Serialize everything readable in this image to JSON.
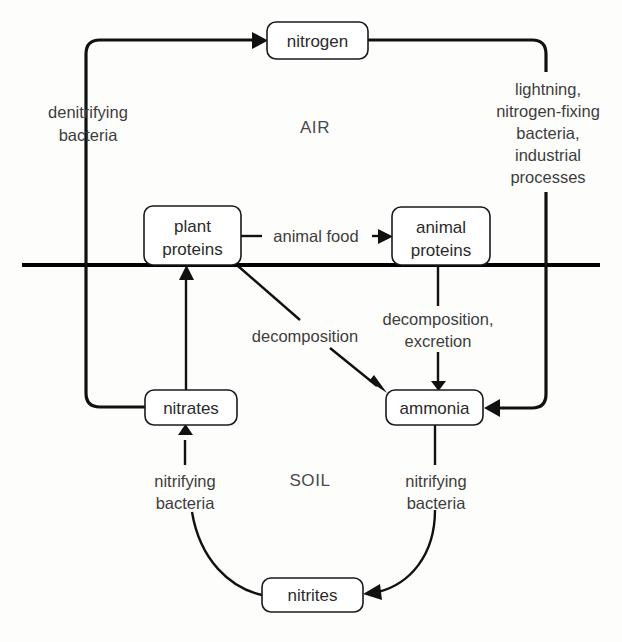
{
  "diagram": {
    "background_color": "#fdfdfc",
    "line_color": "#111111",
    "text_color": "#3a3a3a",
    "regions": [
      {
        "id": "air",
        "label": "AIR",
        "x": 315,
        "y": 127
      },
      {
        "id": "soil",
        "label": "SOIL",
        "x": 310,
        "y": 480
      }
    ],
    "nodes": [
      {
        "id": "nitrogen",
        "label": "nitrogen",
        "lines": [
          "nitrogen"
        ],
        "x": 267,
        "y": 22,
        "w": 101,
        "h": 37
      },
      {
        "id": "plant-proteins",
        "label": "plant proteins",
        "lines": [
          "plant",
          "proteins"
        ],
        "x": 144,
        "y": 206,
        "w": 97,
        "h": 59
      },
      {
        "id": "animal-proteins",
        "label": "animal proteins",
        "lines": [
          "animal",
          "proteins"
        ],
        "x": 392,
        "y": 207,
        "w": 98,
        "h": 58
      },
      {
        "id": "nitrates",
        "label": "nitrates",
        "lines": [
          "nitrates"
        ],
        "x": 145,
        "y": 390,
        "w": 92,
        "h": 35
      },
      {
        "id": "ammonia",
        "label": "ammonia",
        "lines": [
          "ammonia"
        ],
        "x": 386,
        "y": 390,
        "w": 97,
        "h": 35
      },
      {
        "id": "nitrites",
        "label": "nitrites",
        "lines": [
          "nitrites"
        ],
        "x": 262,
        "y": 578,
        "w": 101,
        "h": 34
      }
    ],
    "edge_labels": [
      {
        "id": "denitrifying-bacteria",
        "lines": [
          "denitrifying",
          "bacteria"
        ],
        "x": 88,
        "y": 112
      },
      {
        "id": "nitrogen-fixation",
        "lines": [
          "lightning,",
          "nitrogen-fixing",
          "bacteria,",
          "industrial",
          "processes"
        ],
        "x": 548,
        "y": 90
      },
      {
        "id": "animal-food",
        "lines": [
          "animal  food"
        ],
        "x": 316,
        "y": 242
      },
      {
        "id": "decomposition",
        "lines": [
          "decomposition"
        ],
        "x": 305,
        "y": 336
      },
      {
        "id": "decomposition-excretion",
        "lines": [
          "decomposition,",
          "excretion"
        ],
        "x": 438,
        "y": 329
      },
      {
        "id": "nitrifying-bacteria-left",
        "lines": [
          "nitrifying",
          "bacteria"
        ],
        "x": 185,
        "y": 481
      },
      {
        "id": "nitrifying-bacteria-right",
        "lines": [
          "nitrifying",
          "bacteria"
        ],
        "x": 436,
        "y": 481
      }
    ],
    "flows": [
      {
        "id": "nitrates-to-nitrogen",
        "from": "nitrates",
        "to": "nitrogen",
        "label": "denitrifying bacteria"
      },
      {
        "id": "nitrogen-to-ammonia",
        "from": "nitrogen",
        "to": "ammonia",
        "label": "lightning, nitrogen-fixing bacteria, industrial processes"
      },
      {
        "id": "plant-to-animal-proteins",
        "from": "plant-proteins",
        "to": "animal-proteins",
        "label": "animal  food"
      },
      {
        "id": "plant-proteins-to-ammonia",
        "from": "plant-proteins",
        "to": "ammonia",
        "label": "decomposition"
      },
      {
        "id": "animal-proteins-to-ammonia",
        "from": "animal-proteins",
        "to": "ammonia",
        "label": "decomposition, excretion"
      },
      {
        "id": "ammonia-to-nitrites",
        "from": "ammonia",
        "to": "nitrites",
        "label": "nitrifying bacteria"
      },
      {
        "id": "nitrites-to-nitrates",
        "from": "nitrites",
        "to": "nitrates",
        "label": "nitrifying bacteria"
      },
      {
        "id": "nitrates-to-plant-proteins",
        "from": "nitrates",
        "to": "plant-proteins",
        "label": ""
      }
    ]
  }
}
